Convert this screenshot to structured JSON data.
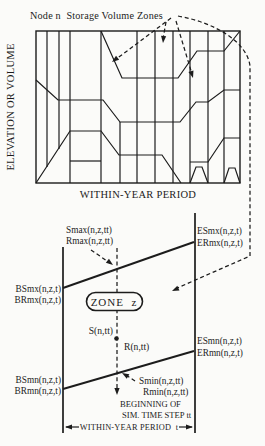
{
  "colors": {
    "ink": "#1c1c1c",
    "paper": "#fbfbf9"
  },
  "figure": {
    "title": "Node n  Storage Volume Zones",
    "upper_chart": {
      "y_axis_label": "ELEVATION OR VOLUME",
      "x_axis_label": "WITHIN-YEAR PERIOD"
    },
    "zone_detail": {
      "smax": "Smax(n,z,tt)",
      "rmax": "Rmax(n,z,tt)",
      "esmx": "ESmx(n,z,t)",
      "ermx": "ERmx(n,z,t)",
      "bsmx": "BSmx(n,z,t)",
      "brmx": "BRmx(n,z,t)",
      "zone_label": "ZONE  z",
      "storage_label": "S(n,tt)",
      "release_label": "R(n,tt)",
      "esmn": "ESmn(n,z,t)",
      "ermn": "ERmn(n,z,t)",
      "bsmn": "BSmn(n,z,t)",
      "brmn": "BRmn(n,z,t)",
      "smin": "Smin(n,z,tt)",
      "rmin": "Rmin(n,z,tt)",
      "time_step_note_line1": "BEGINNING OF",
      "time_step_note_line2": "SIM. TIME STEP tt",
      "period_span_label": "WITHIN-YEAR PERIOD  t"
    }
  }
}
